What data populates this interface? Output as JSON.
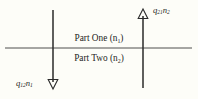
{
  "figure": {
    "background_color": "#fdfdf8",
    "stroke_color": "#2a2a2a",
    "regions": {
      "upper": {
        "name": "Part One",
        "index_label": "Part One (n",
        "sub": "1",
        "close": ")"
      },
      "lower": {
        "name": "Part Two",
        "index_label": "Part Two (n",
        "sub": "2",
        "close": ")"
      }
    },
    "labels": {
      "part_one": "Part One (n₁)",
      "part_two": "Part Two (n₂)",
      "flux_up": "q₂₁n₂",
      "flux_down": "q₁₂n₁",
      "flux_up_base": "q",
      "flux_up_sub1": "21",
      "flux_up_mid": "n",
      "flux_up_sub2": "2",
      "flux_down_base": "q",
      "flux_down_sub1": "12",
      "flux_down_mid": "n",
      "flux_down_sub2": "1"
    },
    "arrows": [
      {
        "name": "downward-flux-arrow",
        "direction": "down",
        "x": 53,
        "y_start": 10,
        "y_end": 88,
        "label": "q₁₂n₁"
      },
      {
        "name": "upward-flux-arrow",
        "direction": "up",
        "x": 143,
        "y_start": 88,
        "y_end": 10,
        "label": "q₂₁n₂"
      }
    ],
    "interface_line": {
      "name": "interface-boundary",
      "x_start": 5,
      "x_end": 192,
      "y": 48
    }
  }
}
